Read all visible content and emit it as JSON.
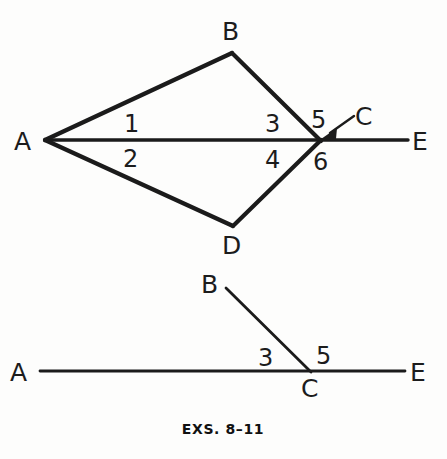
{
  "figure": {
    "caption": "EXS.  8–11",
    "background_color": "#fdfdfc",
    "ink_color": "#1b1b1b"
  },
  "top_diagram": {
    "name": "kite-with-ray-diagram",
    "vertex_labels": {
      "a": "A",
      "b": "B",
      "c": "C",
      "d": "D",
      "e": "E"
    },
    "angle_labels": {
      "one": "1",
      "two": "2",
      "three": "3",
      "four": "4",
      "five": "5",
      "six": "6"
    },
    "points": {
      "A": [
        45,
        140
      ],
      "B": [
        232,
        53
      ],
      "C": [
        320,
        140
      ],
      "D": [
        233,
        226
      ],
      "E": [
        408,
        140
      ]
    },
    "segments": [
      {
        "name": "segment-AB",
        "from": "A",
        "to": "B"
      },
      {
        "name": "segment-BC",
        "from": "B",
        "to": "C"
      },
      {
        "name": "segment-AD",
        "from": "A",
        "to": "D"
      },
      {
        "name": "segment-DC",
        "from": "D",
        "to": "C"
      },
      {
        "name": "segment-AE",
        "from": "A",
        "to": "E"
      }
    ],
    "pointer": {
      "name": "c-label-pointer",
      "from": [
        354,
        117
      ],
      "to": [
        324,
        137
      ]
    }
  },
  "bottom_diagram": {
    "name": "angle-pair-diagram",
    "vertex_labels": {
      "a": "A",
      "b": "B",
      "c": "C",
      "e": "E"
    },
    "angle_labels": {
      "three": "3",
      "five": "5"
    },
    "points": {
      "A": [
        40,
        371
      ],
      "B": [
        226,
        288
      ],
      "C": [
        310,
        371
      ],
      "E": [
        405,
        371
      ]
    },
    "segments": [
      {
        "name": "segment-AE-lower",
        "from": "A",
        "to": "E"
      },
      {
        "name": "segment-BC-lower",
        "from": "B",
        "to": "C"
      }
    ]
  }
}
